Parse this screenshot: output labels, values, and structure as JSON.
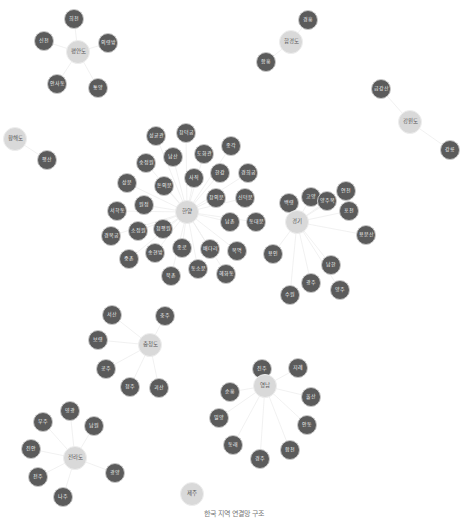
{
  "colors": {
    "leaf_fill": "#5b5b5b",
    "hub_fill": "#d9d9d9",
    "edge": "#eeeeee",
    "caption": "#777777"
  },
  "caption": "한국 지역 연결망 구조",
  "hubs": [
    {
      "id": "pyeongan",
      "label": "평안도",
      "x": 78,
      "y": 52
    },
    {
      "id": "hamgyeong",
      "label": "함경도",
      "x": 291,
      "y": 42
    },
    {
      "id": "hwanghae",
      "label": "황해도",
      "x": 15,
      "y": 139
    },
    {
      "id": "gangwon",
      "label": "강원도",
      "x": 410,
      "y": 122
    },
    {
      "id": "hanyang",
      "label": "한양",
      "x": 187,
      "y": 212
    },
    {
      "id": "gyeonggi",
      "label": "경기",
      "x": 297,
      "y": 222
    },
    {
      "id": "chungcheong",
      "label": "충청도",
      "x": 150,
      "y": 345
    },
    {
      "id": "yeongnam",
      "label": "영남",
      "x": 265,
      "y": 386
    },
    {
      "id": "jeolla",
      "label": "전라도",
      "x": 75,
      "y": 458
    },
    {
      "id": "jeju",
      "label": "제주",
      "x": 192,
      "y": 494
    }
  ],
  "leaves": [
    {
      "hub": "pyeongan",
      "label": "희천",
      "x": 74,
      "y": 19
    },
    {
      "hub": "pyeongan",
      "label": "신천",
      "x": 44,
      "y": 41
    },
    {
      "hub": "pyeongan",
      "label": "의령방",
      "x": 108,
      "y": 43
    },
    {
      "hub": "pyeongan",
      "label": "안사동",
      "x": 57,
      "y": 84
    },
    {
      "hub": "pyeongan",
      "label": "통양",
      "x": 98,
      "y": 88
    },
    {
      "hub": "hamgyeong",
      "label": "경흥",
      "x": 308,
      "y": 20
    },
    {
      "hub": "hamgyeong",
      "label": "함흥",
      "x": 266,
      "y": 62
    },
    {
      "hub": "hwanghae",
      "label": "평산",
      "x": 47,
      "y": 160
    },
    {
      "hub": "gangwon",
      "label": "금강산",
      "x": 381,
      "y": 89
    },
    {
      "hub": "gangwon",
      "label": "강릉",
      "x": 450,
      "y": 150
    },
    {
      "hub": "hanyang",
      "label": "성균관",
      "x": 156,
      "y": 136
    },
    {
      "hub": "hanyang",
      "label": "창덕궁",
      "x": 186,
      "y": 133
    },
    {
      "hub": "hanyang",
      "label": "종각",
      "x": 231,
      "y": 146
    },
    {
      "hub": "hanyang",
      "label": "숭정원",
      "x": 146,
      "y": 163
    },
    {
      "hub": "hanyang",
      "label": "남산",
      "x": 173,
      "y": 157
    },
    {
      "hub": "hanyang",
      "label": "도화관",
      "x": 204,
      "y": 154
    },
    {
      "hub": "hanyang",
      "label": "한강",
      "x": 220,
      "y": 173
    },
    {
      "hub": "hanyang",
      "label": "경희궁",
      "x": 248,
      "y": 173
    },
    {
      "hub": "hanyang",
      "label": "상문",
      "x": 127,
      "y": 183
    },
    {
      "hub": "hanyang",
      "label": "사직",
      "x": 194,
      "y": 178
    },
    {
      "hub": "hanyang",
      "label": "돈의문",
      "x": 164,
      "y": 186
    },
    {
      "hub": "hanyang",
      "label": "원정",
      "x": 144,
      "y": 205
    },
    {
      "hub": "hanyang",
      "label": "서학동",
      "x": 117,
      "y": 211
    },
    {
      "hub": "hanyang",
      "label": "창의문",
      "x": 216,
      "y": 198
    },
    {
      "hub": "hanyang",
      "label": "신덕문",
      "x": 245,
      "y": 198
    },
    {
      "hub": "hanyang",
      "label": "남촌",
      "x": 230,
      "y": 222
    },
    {
      "hub": "hanyang",
      "label": "동대문",
      "x": 256,
      "y": 222
    },
    {
      "hub": "hanyang",
      "label": "경복궁",
      "x": 111,
      "y": 236
    },
    {
      "hub": "hanyang",
      "label": "소정원",
      "x": 138,
      "y": 231
    },
    {
      "hub": "hanyang",
      "label": "청평원",
      "x": 163,
      "y": 229
    },
    {
      "hub": "hanyang",
      "label": "종로",
      "x": 182,
      "y": 248
    },
    {
      "hub": "hanyang",
      "label": "배다리",
      "x": 210,
      "y": 249
    },
    {
      "hub": "hanyang",
      "label": "목멱",
      "x": 237,
      "y": 251
    },
    {
      "hub": "hanyang",
      "label": "중촌",
      "x": 129,
      "y": 259
    },
    {
      "hub": "hanyang",
      "label": "송현방",
      "x": 155,
      "y": 253
    },
    {
      "hub": "hanyang",
      "label": "북촌",
      "x": 171,
      "y": 276
    },
    {
      "hub": "hanyang",
      "label": "동소문",
      "x": 198,
      "y": 269
    },
    {
      "hub": "hanyang",
      "label": "혜화동",
      "x": 226,
      "y": 274
    },
    {
      "hub": "gyeonggi",
      "label": "백령",
      "x": 289,
      "y": 203
    },
    {
      "hub": "gyeonggi",
      "label": "고양",
      "x": 311,
      "y": 197
    },
    {
      "hub": "gyeonggi",
      "label": "양주목",
      "x": 327,
      "y": 201
    },
    {
      "hub": "gyeonggi",
      "label": "연천",
      "x": 346,
      "y": 191
    },
    {
      "hub": "gyeonggi",
      "label": "포천",
      "x": 349,
      "y": 211
    },
    {
      "hub": "gyeonggi",
      "label": "용문산",
      "x": 366,
      "y": 235
    },
    {
      "hub": "gyeonggi",
      "label": "용인",
      "x": 273,
      "y": 254
    },
    {
      "hub": "gyeonggi",
      "label": "남한",
      "x": 331,
      "y": 265
    },
    {
      "hub": "gyeonggi",
      "label": "광주",
      "x": 311,
      "y": 283
    },
    {
      "hub": "gyeonggi",
      "label": "양주",
      "x": 340,
      "y": 290
    },
    {
      "hub": "gyeonggi",
      "label": "수원",
      "x": 290,
      "y": 295
    },
    {
      "hub": "chungcheong",
      "label": "서산",
      "x": 112,
      "y": 315
    },
    {
      "hub": "chungcheong",
      "label": "충주",
      "x": 165,
      "y": 316
    },
    {
      "hub": "chungcheong",
      "label": "보령",
      "x": 98,
      "y": 340
    },
    {
      "hub": "chungcheong",
      "label": "공주",
      "x": 106,
      "y": 369
    },
    {
      "hub": "chungcheong",
      "label": "청주",
      "x": 130,
      "y": 387
    },
    {
      "hub": "chungcheong",
      "label": "괴산",
      "x": 159,
      "y": 388
    },
    {
      "hub": "yeongnam",
      "label": "진주",
      "x": 262,
      "y": 369
    },
    {
      "hub": "yeongnam",
      "label": "지례",
      "x": 298,
      "y": 368
    },
    {
      "hub": "yeongnam",
      "label": "순흥",
      "x": 230,
      "y": 392
    },
    {
      "hub": "yeongnam",
      "label": "울산",
      "x": 311,
      "y": 397
    },
    {
      "hub": "yeongnam",
      "label": "밀양",
      "x": 219,
      "y": 418
    },
    {
      "hub": "yeongnam",
      "label": "안동",
      "x": 307,
      "y": 425
    },
    {
      "hub": "yeongnam",
      "label": "동래",
      "x": 233,
      "y": 445
    },
    {
      "hub": "yeongnam",
      "label": "경주",
      "x": 260,
      "y": 459
    },
    {
      "hub": "yeongnam",
      "label": "합천",
      "x": 290,
      "y": 450
    },
    {
      "hub": "jeolla",
      "label": "영광",
      "x": 70,
      "y": 411
    },
    {
      "hub": "jeolla",
      "label": "무주",
      "x": 43,
      "y": 422
    },
    {
      "hub": "jeolla",
      "label": "남원",
      "x": 94,
      "y": 426
    },
    {
      "hub": "jeolla",
      "label": "진안",
      "x": 31,
      "y": 449
    },
    {
      "hub": "jeolla",
      "label": "전주",
      "x": 38,
      "y": 477
    },
    {
      "hub": "jeolla",
      "label": "광양",
      "x": 115,
      "y": 473
    },
    {
      "hub": "jeolla",
      "label": "나주",
      "x": 63,
      "y": 497
    }
  ]
}
